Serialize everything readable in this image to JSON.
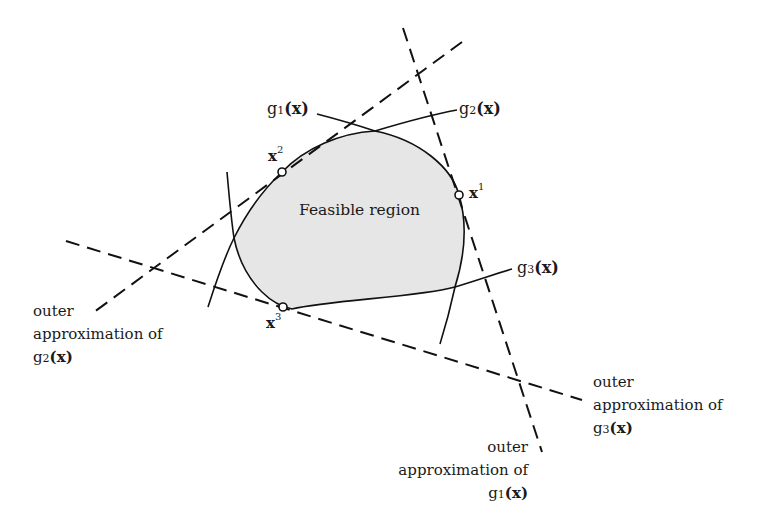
{
  "diagram": {
    "region_label": "Feasible region",
    "colors": {
      "region_fill": "#e6e6e6",
      "stroke": "#111111",
      "background": "#ffffff"
    },
    "functions": [
      {
        "id": "g1",
        "name": "g",
        "index": "1",
        "arg": "(x)"
      },
      {
        "id": "g2",
        "name": "g",
        "index": "2",
        "arg": "(x)"
      },
      {
        "id": "g3",
        "name": "g",
        "index": "3",
        "arg": "(x)"
      }
    ],
    "points": [
      {
        "id": "x1",
        "base": "x",
        "sup": "1"
      },
      {
        "id": "x2",
        "base": "x",
        "sup": "2"
      },
      {
        "id": "x3",
        "base": "x",
        "sup": "3"
      }
    ],
    "outer_approximations": [
      {
        "id": "g1",
        "line1": "outer",
        "line2": "approximation of",
        "fn_name": "g",
        "fn_index": "1",
        "fn_arg": "(x)"
      },
      {
        "id": "g2",
        "line1": "outer",
        "line2": "approximation of",
        "fn_name": "g",
        "fn_index": "2",
        "fn_arg": "(x)"
      },
      {
        "id": "g3",
        "line1": "outer",
        "line2": "approximation of",
        "fn_name": "g",
        "fn_index": "3",
        "fn_arg": "(x)"
      }
    ]
  }
}
